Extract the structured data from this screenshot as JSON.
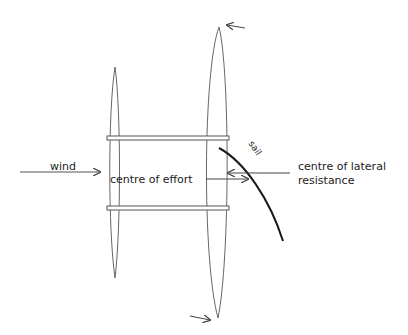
{
  "diagram": {
    "type": "catamaran-forces-plan-view",
    "labels": {
      "wind": "wind",
      "centre_of_effort": "centre of effort",
      "sail": "sail",
      "clr_line1": "centre of lateral",
      "clr_line2": "resistance"
    },
    "colors": {
      "stroke": "#444444",
      "sail": "#1a1a1a",
      "text": "#222222",
      "background": "#ffffff"
    }
  }
}
